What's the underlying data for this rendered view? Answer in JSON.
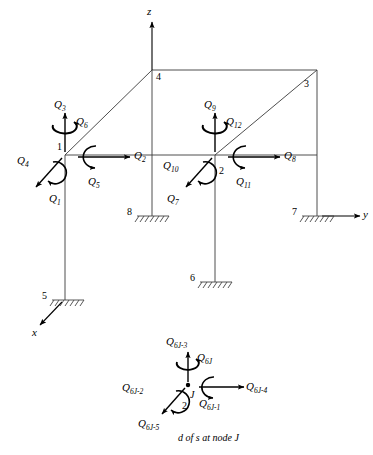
{
  "figure": {
    "caption": "d of s at node J",
    "line_color": "#3a3a3a",
    "arrow_color": "#000000",
    "background": "#ffffff"
  },
  "axes": [
    {
      "name": "z-axis",
      "label": "z"
    },
    {
      "name": "y-axis",
      "label": "y"
    },
    {
      "name": "x-axis",
      "label": "x"
    }
  ],
  "nodes": [
    {
      "id": "1",
      "label": "1",
      "type": "free"
    },
    {
      "id": "2",
      "label": "2",
      "type": "free"
    },
    {
      "id": "3",
      "label": "3",
      "type": "corner"
    },
    {
      "id": "4",
      "label": "4",
      "type": "corner"
    },
    {
      "id": "5",
      "label": "5",
      "type": "support"
    },
    {
      "id": "6",
      "label": "6",
      "type": "support"
    },
    {
      "id": "7",
      "label": "7",
      "type": "support"
    },
    {
      "id": "8",
      "label": "8",
      "type": "support"
    }
  ],
  "dofs_node1": [
    {
      "key": "q1",
      "label": "Q",
      "sub": "1",
      "kind": "force",
      "dir": "x-negative"
    },
    {
      "key": "q2",
      "label": "Q",
      "sub": "2",
      "kind": "force",
      "dir": "y-positive"
    },
    {
      "key": "q3",
      "label": "Q",
      "sub": "3",
      "kind": "force",
      "dir": "z-positive"
    },
    {
      "key": "q4",
      "label": "Q",
      "sub": "4",
      "kind": "moment",
      "dir": "about-x"
    },
    {
      "key": "q5",
      "label": "Q",
      "sub": "5",
      "kind": "moment",
      "dir": "about-y"
    },
    {
      "key": "q6",
      "label": "Q",
      "sub": "6",
      "kind": "moment",
      "dir": "about-z"
    }
  ],
  "dofs_node2": [
    {
      "key": "q7",
      "label": "Q",
      "sub": "7",
      "kind": "force",
      "dir": "x-negative"
    },
    {
      "key": "q8",
      "label": "Q",
      "sub": "8",
      "kind": "force",
      "dir": "y-positive"
    },
    {
      "key": "q9",
      "label": "Q",
      "sub": "9",
      "kind": "force",
      "dir": "z-positive"
    },
    {
      "key": "q10",
      "label": "Q",
      "sub": "10",
      "kind": "moment",
      "dir": "about-x"
    },
    {
      "key": "q11",
      "label": "Q",
      "sub": "11",
      "kind": "moment",
      "dir": "about-y"
    },
    {
      "key": "q12",
      "label": "Q",
      "sub": "12",
      "kind": "moment",
      "dir": "about-z"
    }
  ],
  "detail": {
    "node_label": "J",
    "aux_label": "2",
    "dofs": [
      {
        "key": "d1",
        "label": "Q",
        "sub": "6J-5",
        "kind": "force",
        "dir": "x-negative"
      },
      {
        "key": "d2",
        "label": "Q",
        "sub": "6J-4",
        "kind": "force",
        "dir": "y-positive"
      },
      {
        "key": "d3",
        "label": "Q",
        "sub": "6J-3",
        "kind": "force",
        "dir": "z-positive"
      },
      {
        "key": "d4",
        "label": "Q",
        "sub": "6J-2",
        "kind": "moment",
        "dir": "about-x"
      },
      {
        "key": "d5",
        "label": "Q",
        "sub": "6J-1",
        "kind": "moment",
        "dir": "about-y"
      },
      {
        "key": "d6",
        "label": "Q",
        "sub": "6J",
        "kind": "moment",
        "dir": "about-z"
      }
    ]
  }
}
